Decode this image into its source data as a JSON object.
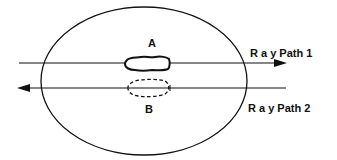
{
  "diagram": {
    "colors": {
      "stroke": "#111111",
      "background": "#ffffff"
    },
    "body": {
      "shape": "ellipse",
      "cx": 144,
      "cy": 81,
      "rx": 103,
      "ry": 74
    },
    "objects": [
      {
        "id": "A",
        "label": "A",
        "style": "solid"
      },
      {
        "id": "B",
        "label": "B",
        "style": "dashed"
      }
    ],
    "rays": [
      {
        "id": "ray1",
        "label": "R a y Path 1",
        "direction": "right"
      },
      {
        "id": "ray2",
        "label": "R a y Path 2",
        "direction": "left"
      }
    ]
  }
}
